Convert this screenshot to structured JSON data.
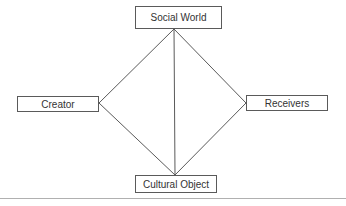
{
  "diagram": {
    "nodes": {
      "social_world": {
        "label": "Social World"
      },
      "creator": {
        "label": "Creator"
      },
      "receivers": {
        "label": "Receivers"
      },
      "cultural_object": {
        "label": "Cultural Object"
      }
    },
    "edges": [
      {
        "from": "social_world",
        "to": "creator"
      },
      {
        "from": "social_world",
        "to": "receivers"
      },
      {
        "from": "social_world",
        "to": "cultural_object"
      },
      {
        "from": "creator",
        "to": "cultural_object"
      },
      {
        "from": "receivers",
        "to": "cultural_object"
      }
    ],
    "colors": {
      "line": "#5a5a5a",
      "box_border": "#5a5a5a",
      "text": "#333333",
      "rule": "#b0b0b0"
    }
  }
}
